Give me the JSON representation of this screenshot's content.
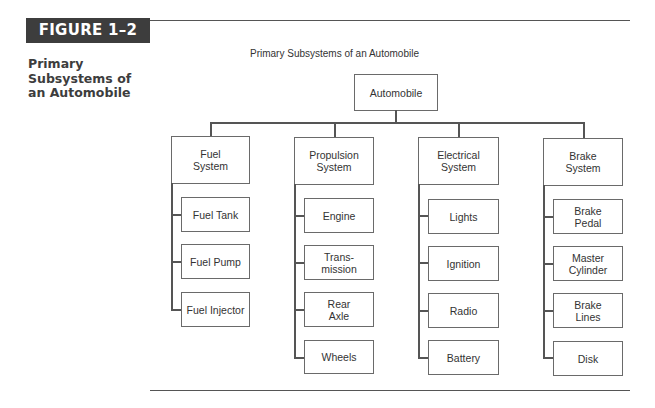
{
  "figure": {
    "label": "FIGURE 1–2",
    "side_title": "Primary Subsystems of an Automobile",
    "diagram_title": "Primary Subsystems of an Automobile"
  },
  "tree": {
    "root": "Automobile",
    "subsystems": [
      {
        "label": "Fuel\nSystem",
        "children": [
          "Fuel Tank",
          "Fuel Pump",
          "Fuel Injector"
        ]
      },
      {
        "label": "Propulsion\nSystem",
        "children": [
          "Engine",
          "Trans-\nmission",
          "Rear\nAxle",
          "Wheels"
        ]
      },
      {
        "label": "Electrical\nSystem",
        "children": [
          "Lights",
          "Ignition",
          "Radio",
          "Battery"
        ]
      },
      {
        "label": "Brake\nSystem",
        "children": [
          "Brake\nPedal",
          "Master\nCylinder",
          "Brake\nLines",
          "Disk"
        ]
      }
    ]
  },
  "colors": {
    "label_bg": "#3d3d3d",
    "line": "#555555",
    "box_border": "#6a6a6a"
  }
}
